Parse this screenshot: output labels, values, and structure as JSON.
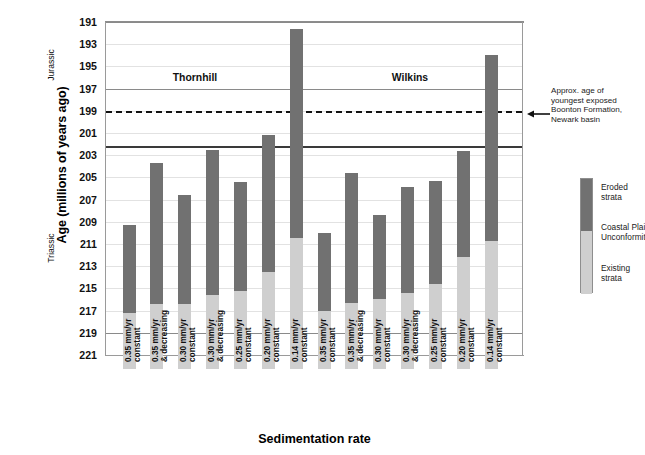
{
  "chart_data": {
    "type": "bar",
    "title": "",
    "xlabel": "Sedimentation rate",
    "ylabel": "Age (millions of years ago)",
    "ylim": [
      221,
      191
    ],
    "y_inverted": true,
    "y_ticks": [
      191,
      193,
      195,
      197,
      199,
      201,
      203,
      205,
      207,
      209,
      211,
      213,
      215,
      217,
      219,
      221
    ],
    "grid": true,
    "legend_position": "right",
    "stacked": true,
    "series": [
      {
        "name": "Eroded strata",
        "color": "#717171"
      },
      {
        "name": "Existing strata",
        "color": "#cfcfcf"
      }
    ],
    "groups": [
      {
        "name": "Thornhill",
        "bars": [
          0,
          1,
          2,
          3,
          4,
          5,
          6
        ]
      },
      {
        "name": "Wilkins",
        "bars": [
          7,
          8,
          9,
          10,
          11,
          12,
          13
        ]
      }
    ],
    "categories": [
      "0.35 mm/yr constant",
      "0.35 mm/yr & decreasing",
      "0.30 mm/yr constant",
      "0.30 mm/yr & decreasing",
      "0.25 mm/yr constant",
      "0.20 mm/yr constant",
      "0.14 mm/yr constant",
      "0.35 mm/yr constant",
      "0.35 mm/yr & decreasing",
      "0.30 mm/yr constant",
      "0.30 mm/yr & decreasing",
      "0.25 mm/yr constant",
      "0.20 mm/yr constant",
      "0.14 mm/yr constant"
    ],
    "bars": [
      {
        "group": "Thornhill",
        "rate": "0.35 mm/yr",
        "mode": "constant",
        "top_age": 209.3,
        "unconformity_age": 217.2,
        "base_age": 222.0
      },
      {
        "group": "Thornhill",
        "rate": "0.35 mm/yr",
        "mode": "& decreasing",
        "top_age": 203.7,
        "unconformity_age": 216.4,
        "base_age": 222.0
      },
      {
        "group": "Thornhill",
        "rate": "0.30 mm/yr",
        "mode": "constant",
        "top_age": 206.6,
        "unconformity_age": 216.4,
        "base_age": 222.0
      },
      {
        "group": "Thornhill",
        "rate": "0.30 mm/yr",
        "mode": "& decreasing",
        "top_age": 202.5,
        "unconformity_age": 215.6,
        "base_age": 222.0
      },
      {
        "group": "Thornhill",
        "rate": "0.25 mm/yr",
        "mode": "constant",
        "top_age": 205.4,
        "unconformity_age": 215.2,
        "base_age": 222.0
      },
      {
        "group": "Thornhill",
        "rate": "0.20 mm/yr",
        "mode": "constant",
        "top_age": 201.2,
        "unconformity_age": 213.5,
        "base_age": 222.0
      },
      {
        "group": "Thornhill",
        "rate": "0.14 mm/yr",
        "mode": "constant",
        "top_age": 191.6,
        "unconformity_age": 210.5,
        "base_age": 222.0
      },
      {
        "group": "Wilkins",
        "rate": "0.35 mm/yr",
        "mode": "constant",
        "top_age": 210.0,
        "unconformity_age": 217.0,
        "base_age": 222.0
      },
      {
        "group": "Wilkins",
        "rate": "0.35 mm/yr",
        "mode": "& decreasing",
        "top_age": 204.6,
        "unconformity_age": 216.3,
        "base_age": 222.0
      },
      {
        "group": "Wilkins",
        "rate": "0.30 mm/yr",
        "mode": "constant",
        "top_age": 208.4,
        "unconformity_age": 216.0,
        "base_age": 222.0
      },
      {
        "group": "Wilkins",
        "rate": "0.30 mm/yr",
        "mode": "& decreasing",
        "top_age": 205.9,
        "unconformity_age": 215.4,
        "base_age": 222.0
      },
      {
        "group": "Wilkins",
        "rate": "0.25 mm/yr",
        "mode": "constant",
        "top_age": 205.3,
        "unconformity_age": 214.6,
        "base_age": 222.0
      },
      {
        "group": "Wilkins",
        "rate": "0.20 mm/yr",
        "mode": "constant",
        "top_age": 202.6,
        "unconformity_age": 212.2,
        "base_age": 222.0
      },
      {
        "group": "Wilkins",
        "rate": "0.14 mm/yr",
        "mode": "constant",
        "top_age": 194.0,
        "unconformity_age": 210.7,
        "base_age": 222.0
      }
    ],
    "reference_lines": [
      {
        "age": 191.0,
        "style": "solid",
        "weight": "heavy"
      },
      {
        "age": 197.0,
        "style": "solid",
        "weight": "heavy"
      },
      {
        "age": 199.0,
        "style": "dashed",
        "weight": "thick",
        "label": "Approx. age of youngest exposed Boonton Formation, Newark basin"
      },
      {
        "age": 202.2,
        "style": "solid",
        "weight": "thick"
      },
      {
        "age": 219.0,
        "style": "solid",
        "weight": "heavy"
      }
    ],
    "era_bands": [
      {
        "name": "Jurassic",
        "from_age": 202.2,
        "to_age": 191.0
      },
      {
        "name": "Triassic",
        "from_age": 221.0,
        "to_age": 202.2
      }
    ],
    "annotations": [
      {
        "name": "boonton-formation-note",
        "lines": [
          "Approx. age of",
          "youngest exposed",
          "Boonton Formation,",
          "Newark basin"
        ],
        "points_to_age": 199.0
      }
    ]
  },
  "axes": {
    "y_title": "Age (millions of years ago)",
    "x_title": "Sedimentation rate",
    "y_ticks": [
      "191",
      "193",
      "195",
      "197",
      "199",
      "201",
      "203",
      "205",
      "207",
      "209",
      "211",
      "213",
      "215",
      "217",
      "219",
      "221"
    ]
  },
  "era_labels": {
    "jurassic": "Jurassic",
    "triassic": "Triassic"
  },
  "group_labels": {
    "thornhill": "Thornhill",
    "wilkins": "Wilkins"
  },
  "xtick_labels": [
    {
      "line1": "0.35 mm/yr",
      "line2": "constant"
    },
    {
      "line1": "0.35 mm/yr",
      "line2": "& decreasing"
    },
    {
      "line1": "0.30 mm/yr",
      "line2": "constant"
    },
    {
      "line1": "0.30 mm/yr",
      "line2": "& decreasing"
    },
    {
      "line1": "0.25 mm/yr",
      "line2": "constant"
    },
    {
      "line1": "0.20 mm/yr",
      "line2": "constant"
    },
    {
      "line1": "0.14 mm/yr",
      "line2": "constant"
    },
    {
      "line1": "0.35 mm/yr",
      "line2": "constant"
    },
    {
      "line1": "0.35 mm/yr",
      "line2": "& decreasing"
    },
    {
      "line1": "0.30 mm/yr",
      "line2": "constant"
    },
    {
      "line1": "0.30 mm/yr",
      "line2": "& decreasing"
    },
    {
      "line1": "0.25 mm/yr",
      "line2": "constant"
    },
    {
      "line1": "0.20 mm/yr",
      "line2": "constant"
    },
    {
      "line1": "0.14 mm/yr",
      "line2": "constant"
    }
  ],
  "legend": {
    "eroded": {
      "line1": "Eroded",
      "line2": "strata"
    },
    "unconformity": {
      "line1": "Coastal Plain",
      "line2": "Unconformity"
    },
    "existing": {
      "line1": "Existing",
      "line2": "strata"
    }
  },
  "annotation": {
    "line1": "Approx. age of",
    "line2": "youngest exposed",
    "line3": "Boonton Formation,",
    "line4": "Newark basin"
  },
  "colors": {
    "eroded_strata": "#717171",
    "existing_strata": "#cfcfcf",
    "gridline": "#e2e2e2",
    "axis": "#9a9a9a",
    "reference_line": "#3a3a3a"
  }
}
